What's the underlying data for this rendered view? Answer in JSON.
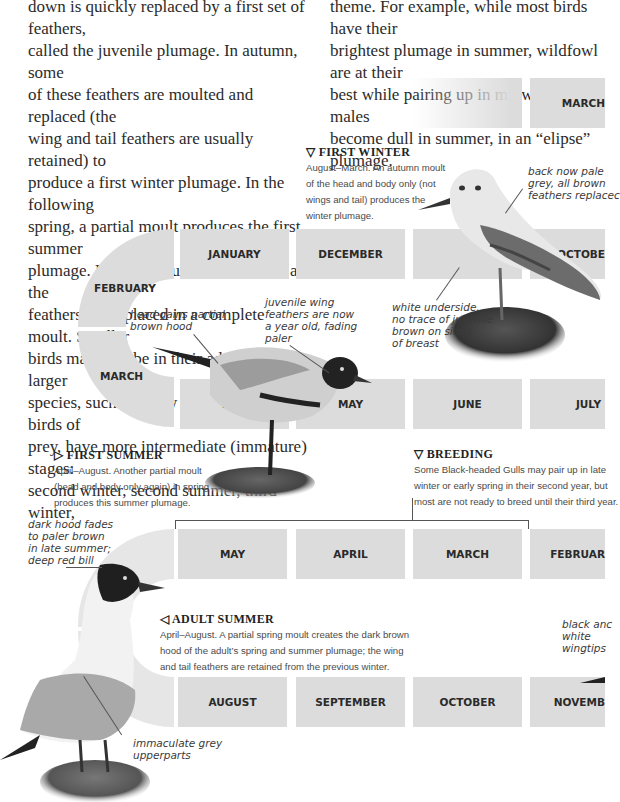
{
  "intro": {
    "left_column_lines": [
      "down is quickly replaced by a first set of feathers,",
      "called the juvenile plumage. In autumn, some",
      "of these feathers are moulted and replaced (the",
      "wing and tail feathers are usually retained) to",
      "produce a first winter plumage. In the following",
      "spring, a partial moult produces the first summer",
      "plumage. From late summer onwards, all the",
      "feathers are replaced in a complete moult. Smaller",
      "birds may now be in their adult plumage; larger",
      "species, such as many of the gulls and birds of",
      "prey, have more intermediate (immature) stages:",
      "second winter, second summer, third winter,"
    ],
    "right_column_lines": [
      "theme.  For example, while most birds have their",
      "brightest plumage in summer, wildfowl are at their",
      "best while pairing up in midwinter; the males",
      "become dull in summer, in an “elipse” plumage."
    ]
  },
  "timeline": {
    "row0": [
      "",
      "MARCH"
    ],
    "curve_top": [
      "FEBRUARY",
      "MARCH"
    ],
    "row1": [
      "JANUARY",
      "DECEMBER",
      "",
      "OCTOBE"
    ],
    "row2": [
      "MAY",
      "MAY",
      "JUNE",
      "JULY"
    ],
    "row3": [
      "MAY",
      "APRIL",
      "MARCH",
      "FEBRUAR"
    ],
    "row4": [
      "AUGUST",
      "SEPTEMBER",
      "OCTOBER",
      "NOVEMB"
    ]
  },
  "stages": {
    "first_winter": {
      "marker": "▽",
      "title": "FIRST WINTER",
      "lines": [
        "August–March. An autumn moult",
        "of the head and body only (not",
        "wings and tail) produces the",
        "winter plumage."
      ]
    },
    "first_summer": {
      "marker": "▷",
      "title": "FIRST  SUMMER",
      "lines": [
        "April–August. Another partial moult",
        "(head and body only again) in spring",
        "produces this summer plumage."
      ]
    },
    "breeding": {
      "marker": "▽",
      "title": "BREEDING",
      "lines": [
        "Some Black-headed Gulls may pair up in late",
        "winter or early spring in their second year, but",
        "most are not ready to breed until their third year."
      ]
    },
    "adult_summer": {
      "marker": "◁",
      "title": "ADULT  SUMMER",
      "lines": [
        "April–August. A partial spring moult creates the dark brown",
        "hood of the adult’s spring and summer plumage; the wing",
        "and tail feathers are retained from the previous winter."
      ]
    }
  },
  "annotations": {
    "back_pale": [
      "back now pale",
      "grey, all brown",
      "feathers replacec"
    ],
    "white_underside": [
      "white underside,",
      "no trace of juvenile",
      "brown on sides",
      "of breast"
    ],
    "head_hood": [
      "head gains partial",
      "brown hood"
    ],
    "juvenile_wing": [
      "juvenile wing",
      "feathers are now",
      "a year old, fading",
      "paler"
    ],
    "dark_hood": [
      "dark hood fades",
      "to paler brown",
      "in late summer;",
      "deep red bill"
    ],
    "wingtips": [
      "black anc",
      "white",
      "wingtips"
    ],
    "upperparts": [
      "immaculate grey",
      "upperparts"
    ]
  },
  "colors": {
    "month_block": "#dcdcdc",
    "text": "#2a2a2a",
    "caption": "#4a4a4a"
  }
}
